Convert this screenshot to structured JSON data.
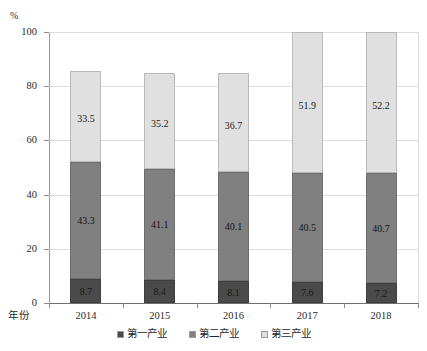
{
  "chart_data": {
    "type": "bar",
    "subtype": "100-percent-stacked",
    "title": "",
    "xlabel": "年份",
    "ylabel": "%",
    "ylim": [
      0,
      100
    ],
    "yticks": [
      0,
      20,
      40,
      60,
      80,
      100
    ],
    "ytick_labels": [
      "0",
      "20",
      "40",
      "60",
      "80",
      "100"
    ],
    "grid": true,
    "legend_position": "bottom-center",
    "categories": [
      "2014",
      "2015",
      "2016",
      "2017",
      "2018"
    ],
    "series": [
      {
        "name": "第一产业",
        "color": "#4a4a4a",
        "values": [
          8.7,
          8.4,
          8.1,
          7.6,
          7.2
        ]
      },
      {
        "name": "第二产业",
        "color": "#808080",
        "values": [
          43.3,
          41.1,
          40.1,
          40.5,
          40.7
        ]
      },
      {
        "name": "第三产业",
        "color": "#e0e0e0",
        "values": [
          33.5,
          35.2,
          36.7,
          51.9,
          52.2
        ]
      }
    ],
    "value_labels": {
      "第一产业": [
        "8.7",
        "8.4",
        "8.1",
        "7.6",
        "7.2"
      ],
      "第二产业": [
        "43.3",
        "41.1",
        "40.1",
        "40.5",
        "40.7"
      ],
      "第三产业": [
        "33.5",
        "35.2",
        "36.7",
        "51.9",
        "52.2"
      ]
    }
  },
  "axis": {
    "unit": "%",
    "x_title": "年份"
  },
  "legend": {
    "items": [
      {
        "label": "第一产业",
        "color": "#4a4a4a"
      },
      {
        "label": "第二产业",
        "color": "#808080"
      },
      {
        "label": "第三产业",
        "color": "#e0e0e0"
      }
    ]
  }
}
